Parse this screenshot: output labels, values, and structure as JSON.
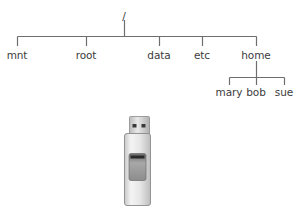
{
  "tree": {
    "root": {
      "label": "/",
      "x": 124,
      "y": 10
    },
    "children": [
      {
        "label": "mnt",
        "x": 17,
        "y": 49
      },
      {
        "label": "root",
        "x": 86,
        "y": 49
      },
      {
        "label": "data",
        "x": 159,
        "y": 49
      },
      {
        "label": "etc",
        "x": 202,
        "y": 49
      },
      {
        "label": "home",
        "x": 256,
        "y": 49
      }
    ],
    "home_children": [
      {
        "label": "mary",
        "x": 229,
        "y": 86
      },
      {
        "label": "bob",
        "x": 256,
        "y": 86
      },
      {
        "label": "sue",
        "x": 284,
        "y": 86
      }
    ],
    "line_color": "#6e6e6e"
  },
  "device": {
    "type": "usb-flash-drive",
    "body_color": "#e2e2e2",
    "outline_color": "#8a8a8a",
    "window_color": "#9c9c9c"
  }
}
